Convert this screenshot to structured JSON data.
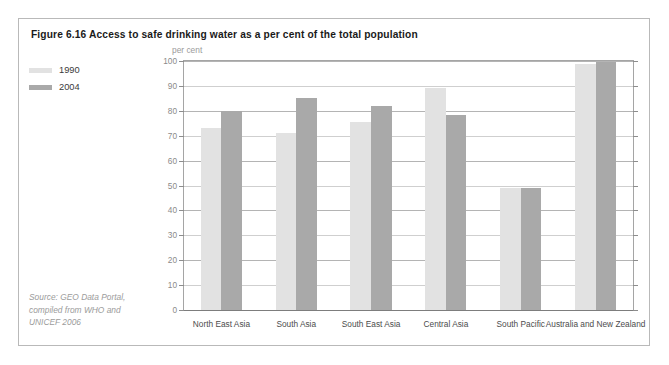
{
  "figure": {
    "title": "Figure 6.16 Access to safe drinking water as a per cent of the total population",
    "source": "Source: GEO Data Portal, compiled from WHO and UNICEF 2006"
  },
  "legend": {
    "items": [
      {
        "label": "1990",
        "color": "#e2e2e2"
      },
      {
        "label": "2004",
        "color": "#a9a9a9"
      }
    ]
  },
  "axis": {
    "unit_label": "per cent",
    "ticks": [
      "100",
      "90",
      "80",
      "70",
      "60",
      "50",
      "40",
      "30",
      "20",
      "10",
      "0"
    ]
  },
  "chart_data": {
    "type": "bar",
    "title": "Figure 6.16 Access to safe drinking water as a per cent of the total population",
    "xlabel": "",
    "ylabel": "per cent",
    "ylim": [
      0,
      100
    ],
    "ytick_step": 10,
    "grid": true,
    "legend_position": "left-outside",
    "categories": [
      "North East Asia",
      "South Asia",
      "South East Asia",
      "Central Asia",
      "South Pacific",
      "Australia and New Zealand"
    ],
    "series": [
      {
        "name": "1990",
        "color": "#e2e2e2",
        "values": [
          73,
          71,
          75.5,
          89,
          49,
          99
        ]
      },
      {
        "name": "2004",
        "color": "#a9a9a9",
        "values": [
          80,
          85,
          82,
          78.5,
          49,
          99.5
        ]
      }
    ],
    "source": "Source: GEO Data Portal, compiled from WHO and UNICEF 2006"
  }
}
